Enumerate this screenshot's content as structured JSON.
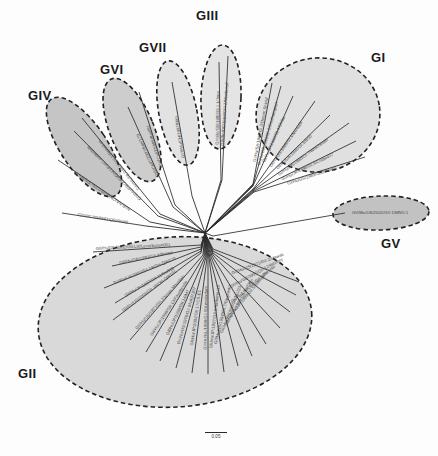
{
  "figure": {
    "type": "phylogenetic-tree",
    "layout": "unrooted-radial",
    "background_color": "#fdfdfd",
    "root_node": {
      "x": 205,
      "y": 233
    }
  },
  "scale": {
    "label": "0.05",
    "bar_px": 22
  },
  "colors": {
    "cluster_fill_light": "#e2e2e2",
    "cluster_fill_mid": "#cfcfcf",
    "cluster_fill_dark": "#b8b8b8",
    "cluster_stroke": "#222222",
    "branch": "#2b2b2b",
    "tip_label": "#444444",
    "group_label": "#1a1a1a"
  },
  "group_labels": [
    {
      "name": "GI",
      "text": "GI",
      "x": 371,
      "y": 50,
      "size": 13
    },
    {
      "name": "GII",
      "text": "GII",
      "x": 18,
      "y": 366,
      "size": 13
    },
    {
      "name": "GIII",
      "text": "GIII",
      "x": 196,
      "y": 8,
      "size": 13
    },
    {
      "name": "GIV",
      "text": "GIV",
      "x": 28,
      "y": 88,
      "size": 13
    },
    {
      "name": "GV",
      "text": "GV",
      "x": 381,
      "y": 236,
      "size": 13
    },
    {
      "name": "GVI",
      "text": "GVI",
      "x": 100,
      "y": 62,
      "size": 13
    },
    {
      "name": "GVII",
      "text": "GVII",
      "x": 139,
      "y": 40,
      "size": 13
    }
  ],
  "clusters": [
    {
      "name": "cluster-gi",
      "group": "GI",
      "cx": 318,
      "cy": 115,
      "rx": 62,
      "ry": 57,
      "rot": -8,
      "fill": "#e0e0e0"
    },
    {
      "name": "cluster-gii",
      "group": "GII",
      "cx": 175,
      "cy": 322,
      "rx": 137,
      "ry": 85,
      "rot": -4,
      "fill": "#d9d9d9"
    },
    {
      "name": "cluster-giii",
      "group": "GIII",
      "cx": 221,
      "cy": 97,
      "rx": 20,
      "ry": 52,
      "rot": 2,
      "fill": "#e4e4e4"
    },
    {
      "name": "cluster-giv",
      "group": "GIV",
      "cx": 84,
      "cy": 147,
      "rx": 23,
      "ry": 58,
      "rot": -34,
      "fill": "#c5c5c5"
    },
    {
      "name": "cluster-gv",
      "group": "GV",
      "cx": 381,
      "cy": 213,
      "rx": 48,
      "ry": 17,
      "rot": -2,
      "fill": "#c2c2c2"
    },
    {
      "name": "cluster-gvi",
      "group": "GVI",
      "cx": 132,
      "cy": 130,
      "rx": 22,
      "ry": 55,
      "rot": -22,
      "fill": "#cdcdcd"
    },
    {
      "name": "cluster-gvii",
      "group": "GVII",
      "cx": 178,
      "cy": 113,
      "rx": 19,
      "ry": 53,
      "rot": -11,
      "fill": "#e2e2e2"
    }
  ],
  "tips": [
    {
      "group": "GI",
      "label": "GI/Hu/SA/1986/GI.3/Desert Shield",
      "x1": 253,
      "y1": 184,
      "x2": 272,
      "y2": 83,
      "tx": 262,
      "ty": 130,
      "rot": -79
    },
    {
      "group": "GI",
      "label": "GI/Hu/GB/1993/GI.2/Southampton",
      "x1": 253,
      "y1": 185,
      "x2": 281,
      "y2": 86,
      "tx": 269,
      "ty": 134,
      "rot": -74
    },
    {
      "group": "GI",
      "label": "GI/Hu/JP/2000/GI.4/Chiba",
      "x1": 253,
      "y1": 186,
      "x2": 293,
      "y2": 96,
      "tx": 275,
      "ty": 140,
      "rot": -66
    },
    {
      "group": "GI",
      "label": "GI/Hu/US/1968/GI.1/Norwalk",
      "x1": 254,
      "y1": 188,
      "x2": 315,
      "y2": 101,
      "tx": 287,
      "ty": 145,
      "rot": -55
    },
    {
      "group": "GI",
      "label": "GI/Hu/DK/1990/GI.5/BS5",
      "x1": 254,
      "y1": 189,
      "x2": 330,
      "y2": 115,
      "tx": 295,
      "ty": 153,
      "rot": -44
    },
    {
      "group": "GI",
      "label": "GI/Hu/DK/1990/GI.7/Winchester",
      "x1": 254,
      "y1": 190,
      "x2": 349,
      "y2": 123,
      "tx": 304,
      "ty": 158,
      "rot": -36
    },
    {
      "group": "GI",
      "label": "GI/Hu/JP/1996/GI.6/Chiba407",
      "x1": 254,
      "y1": 191,
      "x2": 356,
      "y2": 141,
      "tx": 308,
      "ty": 168,
      "rot": -26
    },
    {
      "group": "GI",
      "label": "GI/Hu/US/1989/GI.8/Boxer",
      "x1": 254,
      "y1": 192,
      "x2": 365,
      "y2": 157,
      "tx": 312,
      "ty": 177,
      "rot": -18
    },
    {
      "group": "GIII",
      "label": "GIII/Bo/GB/1980/GIII.1/Jena",
      "x1": 221,
      "y1": 180,
      "x2": 219,
      "y2": 62,
      "tx": 219,
      "ty": 118,
      "rot": -89
    },
    {
      "group": "GIII",
      "label": "GIII/Bo/DE/1998/GIII.2/Newbury2",
      "x1": 222,
      "y1": 180,
      "x2": 228,
      "y2": 56,
      "tx": 226,
      "ty": 114,
      "rot": -86
    },
    {
      "group": "GVII",
      "label": "GVII/Hu/CH/1997/Hiro",
      "x1": 192,
      "y1": 196,
      "x2": 172,
      "y2": 82,
      "tx": 181,
      "ty": 137,
      "rot": -100
    },
    {
      "group": "GVI",
      "label": "GVI/Ca/IT/1999/Bari/91",
      "x1": 175,
      "y1": 205,
      "x2": 139,
      "y2": 92,
      "tx": 156,
      "ty": 146,
      "rot": -108
    },
    {
      "group": "GVI",
      "label": "GVI/Ca/IT/2007/Bari/170",
      "x1": 173,
      "y1": 207,
      "x2": 128,
      "y2": 107,
      "tx": 149,
      "ty": 155,
      "rot": -115
    },
    {
      "group": "GIV",
      "label": "GIV/Hu/NL/1998/GIV.1/Alphatron",
      "x1": 160,
      "y1": 214,
      "x2": 82,
      "y2": 118,
      "tx": 120,
      "ty": 164,
      "rot": -129
    },
    {
      "group": "GIV",
      "label": "GIV/Hu/FR/2003/GIV.1/Fort Lauderdale",
      "x1": 158,
      "y1": 216,
      "x2": 74,
      "y2": 131,
      "tx": 115,
      "ty": 172,
      "rot": -135
    },
    {
      "group": "ungrouped",
      "label": "NoB-NA/Chiba/99/0206/JPN/MV70",
      "x1": 150,
      "y1": 222,
      "x2": 58,
      "y2": 160,
      "tx": 103,
      "ty": 190,
      "rot": -146
    },
    {
      "group": "ungrouped",
      "label": "GI/Hu/SO/1999/GII.10/U22",
      "x1": 146,
      "y1": 226,
      "x2": 62,
      "y2": 213,
      "tx": 103,
      "ty": 217,
      "rot": -171
    },
    {
      "group": "GV",
      "label": "GV/Mu/US/2002/GV.1/MNV-1",
      "x1": 213,
      "y1": 236,
      "x2": 345,
      "y2": 213,
      "tx": 380,
      "ty": 214,
      "rot": 0
    },
    {
      "group": "GII",
      "label": "GII/Hu/DE/2002/GII.Lst/Leverkusen001",
      "x1": 201,
      "y1": 245,
      "x2": 93,
      "y2": 252,
      "tx": 133,
      "ty": 248,
      "rot": -3
    },
    {
      "group": "GII",
      "label": "GII/Hu/GB/1993/GII.4/Bristol",
      "x1": 201,
      "y1": 247,
      "x2": 112,
      "y2": 266,
      "tx": 146,
      "ty": 259,
      "rot": -11
    },
    {
      "group": "GII",
      "label": "GII/Po/US/2003/GII.19/OH-QW170",
      "x1": 201,
      "y1": 249,
      "x2": 104,
      "y2": 288,
      "tx": 145,
      "ty": 272,
      "rot": -22
    },
    {
      "group": "GII",
      "label": "GII/Hu/JP/1997/GII.11/Sw918",
      "x1": 201,
      "y1": 251,
      "x2": 115,
      "y2": 303,
      "tx": 150,
      "ty": 283,
      "rot": -30
    },
    {
      "group": "GII",
      "label": "GII/Po/US/2003/GII.18/OH-QW101",
      "x1": 201,
      "y1": 253,
      "x2": 113,
      "y2": 320,
      "tx": 150,
      "ty": 292,
      "rot": -37
    },
    {
      "group": "GII",
      "label": "GII/Hu/US/1971/GII.2/Snow Mountain",
      "x1": 203,
      "y1": 255,
      "x2": 130,
      "y2": 340,
      "tx": 161,
      "ty": 303,
      "rot": -48
    },
    {
      "group": "GII",
      "label": "GII/Hu/JP/1998/GII.13/Fayetteville",
      "x1": 204,
      "y1": 256,
      "x2": 146,
      "y2": 352,
      "tx": 170,
      "ty": 309,
      "rot": -57
    },
    {
      "group": "GII",
      "label": "GII/Hu/JP/1999/GII.14/M7",
      "x1": 205,
      "y1": 257,
      "x2": 160,
      "y2": 361,
      "tx": 179,
      "ty": 313,
      "rot": -65
    },
    {
      "group": "GII",
      "label": "GII/Hu/US/1976/GII.9/VA97207",
      "x1": 206,
      "y1": 257,
      "x2": 176,
      "y2": 368,
      "tx": 188,
      "ty": 316,
      "rot": -74
    },
    {
      "group": "GII",
      "label": "GII/Hu/JP/2002/GII.17/CS-E1",
      "x1": 207,
      "y1": 258,
      "x2": 192,
      "y2": 373,
      "tx": 197,
      "ty": 318,
      "rot": -82
    },
    {
      "group": "GII",
      "label": "GII/Hu/NL/1999/GII.8/Amsterdam",
      "x1": 208,
      "y1": 258,
      "x2": 208,
      "y2": 374,
      "tx": 207,
      "ty": 318,
      "rot": -89
    },
    {
      "group": "GII",
      "label": "GII/Hu/JP/1997/GII.6/Saitama U3",
      "x1": 209,
      "y1": 258,
      "x2": 224,
      "y2": 372,
      "tx": 216,
      "ty": 317,
      "rot": -83
    },
    {
      "group": "GII",
      "label": "GII/Hu/US/1994/GII.7/Gwynedd",
      "x1": 210,
      "y1": 258,
      "x2": 238,
      "y2": 366,
      "tx": 224,
      "ty": 315,
      "rot": -76
    },
    {
      "group": "GII",
      "label": "GII/Hu/JP/1998/GII.15/J23",
      "x1": 211,
      "y1": 257,
      "x2": 252,
      "y2": 356,
      "tx": 232,
      "ty": 310,
      "rot": -68
    },
    {
      "group": "GII",
      "label": "GII/Hu/US/1999/GII.16/Tiffin",
      "x1": 212,
      "y1": 256,
      "x2": 266,
      "y2": 344,
      "tx": 240,
      "ty": 303,
      "rot": -60
    },
    {
      "group": "GII",
      "label": "GII/Hu/JP/1999/GII.5/Hillingdon",
      "x1": 213,
      "y1": 255,
      "x2": 280,
      "y2": 328,
      "tx": 249,
      "ty": 295,
      "rot": -50
    },
    {
      "group": "GII",
      "label": "GII/Hu/US/1998/GII.3/Toronto",
      "x1": 213,
      "y1": 253,
      "x2": 290,
      "y2": 312,
      "tx": 254,
      "ty": 285,
      "rot": -40
    },
    {
      "group": "GII",
      "label": "GII/Hu/GB/1990/GII.12/Wortley",
      "x1": 213,
      "y1": 251,
      "x2": 296,
      "y2": 295,
      "tx": 257,
      "ty": 274,
      "rot": -28
    },
    {
      "group": "GII",
      "label": "GII/Hu/US/1971/GII.1/Hawaii",
      "x1": 213,
      "y1": 249,
      "x2": 299,
      "y2": 282,
      "tx": 258,
      "ty": 265,
      "rot": -20
    }
  ]
}
